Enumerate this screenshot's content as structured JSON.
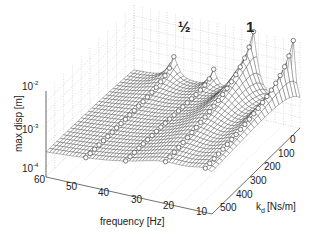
{
  "chart_data": {
    "type": "surface3d",
    "title": "",
    "zlabel": "max disp [m]",
    "xlabel": "frequency [Hz]",
    "ylabel_main": "k",
    "ylabel_sub": "d",
    "ylabel_unit": "[Ns/m]",
    "zscale": "log",
    "zlim": [
      0.0001,
      0.01
    ],
    "z_ticks": [
      {
        "base": "10",
        "exp": "-2"
      },
      {
        "base": "10",
        "exp": "-3"
      },
      {
        "base": "10",
        "exp": "-4"
      }
    ],
    "x_ticks": [
      "60",
      "50",
      "40",
      "30",
      "20",
      "10"
    ],
    "xlim": [
      10,
      60
    ],
    "y_ticks": [
      "0",
      "100",
      "200",
      "300",
      "400",
      "500"
    ],
    "ylim": [
      0,
      500
    ],
    "annotations": [
      "½",
      "1"
    ],
    "grid": true,
    "peaks": [
      {
        "label": "½",
        "frequency_hz": 24,
        "max_disp_at_kd0": 0.01
      },
      {
        "label": "1",
        "frequency_hz": 12,
        "max_disp_at_kd0": 0.01
      },
      {
        "label": "",
        "frequency_hz": 48,
        "max_disp_at_kd0": 0.001
      },
      {
        "label": "",
        "frequency_hz": 36,
        "max_disp_at_kd0": 0.0008
      }
    ],
    "baseline_disp": 0.0003,
    "markers": "circles along resonance ridges"
  }
}
